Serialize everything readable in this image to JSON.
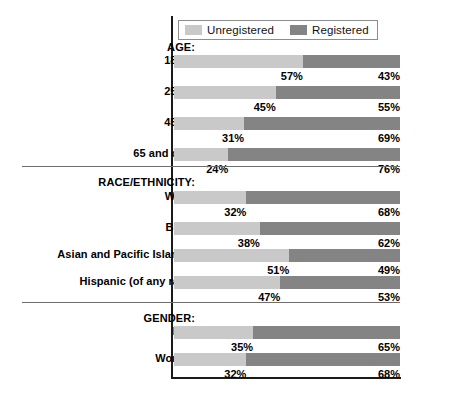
{
  "legend": {
    "items": [
      {
        "label": "Unregistered",
        "color": "#c9c9c9",
        "name": "legend-unregistered"
      },
      {
        "label": "Registered",
        "color": "#848484",
        "name": "legend-registered"
      }
    ]
  },
  "colors": {
    "unregistered": "#c9c9c9",
    "registered": "#848484",
    "axis": "#1a1a1a",
    "divider": "#6e6e6e",
    "text": "#000000",
    "background": "#ffffff"
  },
  "chart_data": {
    "type": "bar",
    "subtype": "stacked-horizontal-100pct",
    "title": "",
    "xlabel": "",
    "ylabel": "",
    "xlim": [
      0,
      100
    ],
    "grid": false,
    "legend_position": "top",
    "series": [
      {
        "name": "Unregistered",
        "color": "#c9c9c9"
      },
      {
        "name": "Registered",
        "color": "#848484"
      }
    ],
    "sections": [
      {
        "title": "AGE:",
        "rows": [
          {
            "label": "18–24",
            "unregistered": 57,
            "registered": 43,
            "left_label": "57%",
            "right_label": "43%"
          },
          {
            "label": "25–44",
            "unregistered": 45,
            "registered": 55,
            "left_label": "45%",
            "right_label": "55%"
          },
          {
            "label": "45–64",
            "unregistered": 31,
            "registered": 69,
            "left_label": "31%",
            "right_label": "69%"
          },
          {
            "label": "65 and over",
            "unregistered": 24,
            "registered": 76,
            "left_label": "24%",
            "right_label": "76%"
          }
        ]
      },
      {
        "title": "RACE/ETHNICITY:",
        "rows": [
          {
            "label": "White",
            "unregistered": 32,
            "registered": 68,
            "left_label": "32%",
            "right_label": "68%"
          },
          {
            "label": "Black",
            "unregistered": 38,
            "registered": 62,
            "left_label": "38%",
            "right_label": "62%"
          },
          {
            "label": "Asian and Pacific Islander",
            "unregistered": 51,
            "registered": 49,
            "left_label": "51%",
            "right_label": "49%"
          },
          {
            "label": "Hispanic (of any race)",
            "unregistered": 47,
            "registered": 53,
            "left_label": "47%",
            "right_label": "53%"
          }
        ]
      },
      {
        "title": "GENDER:",
        "rows": [
          {
            "label": "Men",
            "unregistered": 35,
            "registered": 65,
            "left_label": "35%",
            "right_label": "65%"
          },
          {
            "label": "Women",
            "unregistered": 32,
            "registered": 68,
            "left_label": "32%",
            "right_label": "68%"
          }
        ]
      }
    ]
  }
}
